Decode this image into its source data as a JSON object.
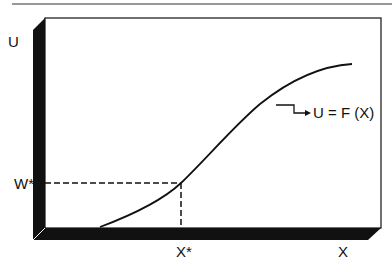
{
  "diagram": {
    "type": "utility-function-plot",
    "axis_labels": {
      "y": "U",
      "x": "X"
    },
    "reference_labels": {
      "y_point": "W*",
      "x_point": "X*"
    },
    "curve_label": "U = F (X)",
    "colors": {
      "ink": "#111111",
      "background": "#ffffff"
    }
  }
}
